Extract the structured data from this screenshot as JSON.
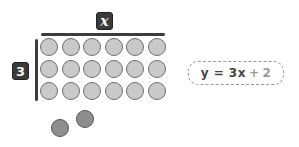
{
  "labels": {
    "width_label": "x",
    "height_label": "3"
  },
  "array": {
    "rows": 3,
    "columns": 6,
    "dot_color": "#c9c9c9",
    "dot_border": "#707070"
  },
  "extra": {
    "count": 2,
    "dot_color": "#8e8e8e"
  },
  "equation": {
    "lhs": "y = 3x",
    "op": "+",
    "constant": "2"
  }
}
